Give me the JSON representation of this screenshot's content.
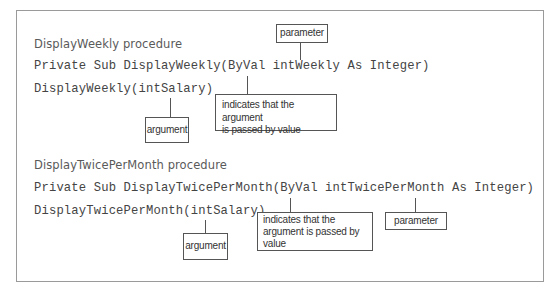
{
  "sections": [
    {
      "title": "DisplayWeekly procedure",
      "code_lines": [
        "Private Sub DisplayWeekly(ByVal intWeekly As Integer)",
        "DisplayWeekly(intSalary)"
      ],
      "callouts": {
        "parameter": "parameter",
        "byval_note": "indicates that the argument is passed by value",
        "byval_note_lines": [
          "indicates that the argument",
          "is passed by value"
        ],
        "argument": "argument"
      }
    },
    {
      "title": "DisplayTwicePerMonth procedure",
      "code_lines": [
        "Private Sub DisplayTwicePerMonth(ByVal intTwicePerMonth As Integer)",
        "DisplayTwicePerMonth(intSalary)"
      ],
      "callouts": {
        "parameter": "parameter",
        "byval_note": "indicates that the argument is passed by value",
        "byval_note_lines": [
          "indicates that the",
          "argument is passed by",
          "value"
        ],
        "argument": "argument"
      }
    }
  ],
  "colors": {
    "panel_border": "#9a9a9a",
    "title_text": "#5a5a5a",
    "code_text": "#444444",
    "callout_border": "#555555",
    "callout_text": "#333333"
  }
}
